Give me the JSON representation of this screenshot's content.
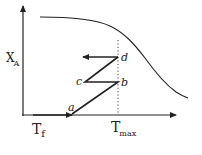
{
  "diagram": {
    "type": "conversion-temperature diagram (multi-stage adiabatic reactor with interstage cooling)",
    "y_axis": {
      "label": "X",
      "subscript": "A"
    },
    "x_axis": {
      "ticks": [
        {
          "label": "T",
          "subscript": "f"
        },
        {
          "label": "T",
          "subscript": "max"
        }
      ]
    },
    "points": [
      {
        "label": "a"
      },
      {
        "label": "b"
      },
      {
        "label": "c"
      },
      {
        "label": "d"
      }
    ],
    "curve": "equilibrium conversion curve (decreasing with temperature)",
    "reference_line": "dotted vertical line at T_max",
    "colors": {
      "ink": "#222222",
      "background": "#ffffff"
    }
  }
}
